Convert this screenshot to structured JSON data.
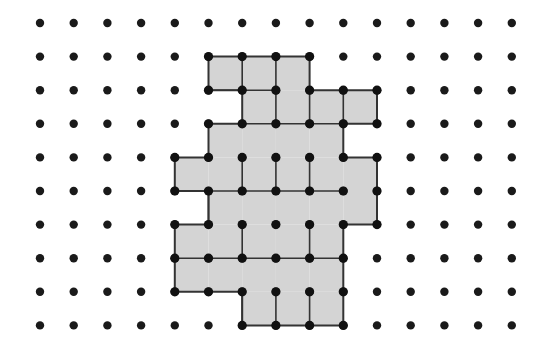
{
  "figure": {
    "name": "dot-grid-polyomino",
    "type": "geometric-lattice-figure",
    "canvas": {
      "width": 556,
      "height": 352,
      "background": "#ffffff"
    },
    "grid": {
      "columns": 15,
      "rows": 10,
      "origin_x": 40,
      "origin_y": 23,
      "spacing_x": 33.7,
      "spacing_y": 33.6,
      "dot_radius": 4.2,
      "dot_color": "#1a1a1a"
    },
    "shape": {
      "fill_color": "#d4d4d4",
      "outline_color": "#333333",
      "outline_width": 2.0,
      "tile_edge_color": "#333333",
      "tile_edge_width": 1.6,
      "vertex_dot_color": "#111111",
      "vertex_dot_radius": 4.6,
      "cells": [
        [
          5,
          1
        ],
        [
          6,
          1
        ],
        [
          7,
          1
        ],
        [
          6,
          2
        ],
        [
          7,
          2
        ],
        [
          8,
          2
        ],
        [
          9,
          2
        ],
        [
          5,
          3
        ],
        [
          6,
          3
        ],
        [
          7,
          3
        ],
        [
          8,
          3
        ],
        [
          4,
          4
        ],
        [
          5,
          4
        ],
        [
          6,
          4
        ],
        [
          7,
          4
        ],
        [
          8,
          4
        ],
        [
          9,
          4
        ],
        [
          5,
          5
        ],
        [
          6,
          5
        ],
        [
          7,
          5
        ],
        [
          8,
          5
        ],
        [
          9,
          5
        ],
        [
          4,
          6
        ],
        [
          5,
          6
        ],
        [
          6,
          6
        ],
        [
          7,
          6
        ],
        [
          8,
          6
        ],
        [
          4,
          7
        ],
        [
          5,
          7
        ],
        [
          6,
          7
        ],
        [
          7,
          7
        ],
        [
          8,
          7
        ],
        [
          6,
          8
        ],
        [
          7,
          8
        ],
        [
          8,
          8
        ]
      ],
      "tiles": [
        {
          "label": "T1",
          "orientation": "horizontal",
          "cells": [
            [
              5,
              1
            ],
            [
              6,
              1
            ]
          ]
        },
        {
          "label": "T2",
          "orientation": "vertical",
          "cells": [
            [
              7,
              1
            ],
            [
              7,
              2
            ]
          ]
        },
        {
          "label": "T3",
          "orientation": "horizontal",
          "cells": [
            [
              8,
              2
            ],
            [
              9,
              2
            ]
          ]
        },
        {
          "label": "T4",
          "orientation": "vertical",
          "cells": [
            [
              6,
              2
            ],
            [
              6,
              3
            ]
          ]
        },
        {
          "label": "T5",
          "orientation": "vertical",
          "cells": [
            [
              5,
              3
            ],
            [
              5,
              4
            ]
          ]
        },
        {
          "label": "T6",
          "orientation": "horizontal",
          "cells": [
            [
              7,
              3
            ],
            [
              8,
              3
            ]
          ]
        },
        {
          "label": "T7",
          "orientation": "horizontal",
          "cells": [
            [
              4,
              4
            ],
            [
              4,
              5
            ]
          ]
        },
        {
          "label": "T8",
          "orientation": "horizontal",
          "cells": [
            [
              6,
              4
            ],
            [
              7,
              4
            ]
          ]
        },
        {
          "label": "T9",
          "orientation": "horizontal",
          "cells": [
            [
              8,
              4
            ],
            [
              9,
              4
            ]
          ]
        },
        {
          "label": "T10",
          "orientation": "vertical",
          "cells": [
            [
              5,
              5
            ],
            [
              5,
              6
            ]
          ]
        },
        {
          "label": "T11",
          "orientation": "horizontal",
          "cells": [
            [
              6,
              5
            ],
            [
              7,
              5
            ]
          ]
        },
        {
          "label": "T12",
          "orientation": "vertical",
          "cells": [
            [
              9,
              5
            ],
            [
              9,
              6
            ]
          ]
        },
        {
          "label": "T13",
          "orientation": "horizontal",
          "cells": [
            [
              4,
              6
            ],
            [
              4,
              7
            ]
          ]
        },
        {
          "label": "T14",
          "orientation": "horizontal",
          "cells": [
            [
              6,
              6
            ],
            [
              7,
              6
            ]
          ]
        },
        {
          "label": "T15",
          "orientation": "horizontal",
          "cells": [
            [
              6,
              7
            ],
            [
              7,
              7
            ]
          ]
        },
        {
          "label": "T16",
          "orientation": "horizontal",
          "cells": [
            [
              7,
              8
            ],
            [
              8,
              8
            ]
          ]
        }
      ],
      "outline_path_cols_rows": [
        [
          5,
          1
        ],
        [
          8,
          1
        ],
        [
          8,
          2
        ],
        [
          10,
          2
        ],
        [
          10,
          4
        ],
        [
          9,
          4
        ],
        [
          9,
          3
        ],
        [
          8,
          3
        ],
        [
          8,
          4
        ],
        [
          11,
          4
        ],
        [
          11,
          6
        ],
        [
          9,
          6
        ],
        [
          9,
          7
        ],
        [
          10,
          7
        ],
        [
          10,
          9
        ],
        [
          6,
          9
        ],
        [
          6,
          8
        ],
        [
          4,
          8
        ],
        [
          4,
          6
        ],
        [
          5,
          6
        ],
        [
          5,
          7
        ],
        [
          6,
          7
        ],
        [
          6,
          6
        ],
        [
          4,
          6
        ],
        [
          4,
          5
        ],
        [
          5,
          5
        ],
        [
          5,
          4
        ],
        [
          6,
          4
        ],
        [
          6,
          3
        ],
        [
          5,
          3
        ],
        [
          5,
          1
        ]
      ],
      "interior_segments_cols_rows": [
        [
          [
            6,
            1
          ],
          [
            6,
            2
          ]
        ],
        [
          [
            7,
            1
          ],
          [
            7,
            3
          ]
        ],
        [
          [
            5,
            2
          ],
          [
            7,
            2
          ]
        ],
        [
          [
            8,
            2
          ],
          [
            8,
            3
          ]
        ],
        [
          [
            9,
            2
          ],
          [
            9,
            3
          ]
        ],
        [
          [
            6,
            3
          ],
          [
            9,
            3
          ]
        ],
        [
          [
            6,
            4
          ],
          [
            6,
            5
          ]
        ],
        [
          [
            7,
            4
          ],
          [
            7,
            5
          ]
        ],
        [
          [
            8,
            4
          ],
          [
            8,
            5
          ]
        ],
        [
          [
            4,
            5
          ],
          [
            9,
            5
          ]
        ],
        [
          [
            5,
            5
          ],
          [
            5,
            6
          ]
        ],
        [
          [
            6,
            6
          ],
          [
            6,
            7
          ]
        ],
        [
          [
            8,
            6
          ],
          [
            8,
            7
          ]
        ],
        [
          [
            4,
            7
          ],
          [
            9,
            7
          ]
        ],
        [
          [
            6,
            8
          ],
          [
            6,
            9
          ]
        ],
        [
          [
            8,
            8
          ],
          [
            8,
            9
          ]
        ],
        [
          [
            7,
            8
          ],
          [
            7,
            9
          ]
        ]
      ]
    }
  }
}
